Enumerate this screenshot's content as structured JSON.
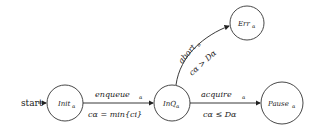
{
  "diagram": {
    "type": "state-machine",
    "start_label": "start",
    "states": [
      {
        "id": "init",
        "label": "Init",
        "sub": "α"
      },
      {
        "id": "inq",
        "label": "InQ",
        "sub": "α"
      },
      {
        "id": "err",
        "label": "Err",
        "sub": "α"
      },
      {
        "id": "pause",
        "label": "Pause",
        "sub": "α"
      }
    ],
    "transitions": [
      {
        "from": "init",
        "to": "inq",
        "action": "enqueue",
        "action_sub": "α",
        "guard": "cα = min{ci}"
      },
      {
        "from": "inq",
        "to": "err",
        "action": "abort",
        "action_sub": "α",
        "guard": "cα > Dα"
      },
      {
        "from": "inq",
        "to": "pause",
        "action": "acquire",
        "action_sub": "α",
        "guard": "cα ≤ Dα"
      }
    ]
  }
}
